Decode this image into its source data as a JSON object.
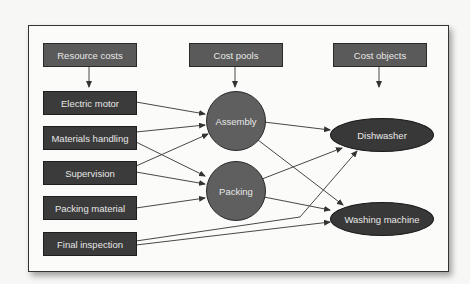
{
  "headers": {
    "resource_costs": "Resource costs",
    "cost_pools": "Cost pools",
    "cost_objects": "Cost objects"
  },
  "resources": [
    {
      "label": "Electric motor"
    },
    {
      "label": "Materials handling"
    },
    {
      "label": "Supervision"
    },
    {
      "label": "Packing material"
    },
    {
      "label": "Final inspection"
    }
  ],
  "pools": [
    {
      "label": "Assembly"
    },
    {
      "label": "Packing"
    }
  ],
  "objects": [
    {
      "label": "Dishwasher"
    },
    {
      "label": "Washing machine"
    }
  ],
  "edges": [
    [
      "Electric motor",
      "Assembly"
    ],
    [
      "Materials handling",
      "Assembly"
    ],
    [
      "Materials handling",
      "Packing"
    ],
    [
      "Supervision",
      "Assembly"
    ],
    [
      "Supervision",
      "Packing"
    ],
    [
      "Packing material",
      "Packing"
    ],
    [
      "Final inspection",
      "Dishwasher"
    ],
    [
      "Final inspection",
      "Washing machine"
    ],
    [
      "Assembly",
      "Dishwasher"
    ],
    [
      "Assembly",
      "Washing machine"
    ],
    [
      "Packing",
      "Dishwasher"
    ],
    [
      "Packing",
      "Washing machine"
    ]
  ],
  "colors": {
    "header_fill": "#5a5a5a",
    "resource_fill": "#3b3b3b",
    "pool_fill": "#5f5f5f",
    "object_fill": "#383838",
    "text": "#e8e8e8"
  }
}
